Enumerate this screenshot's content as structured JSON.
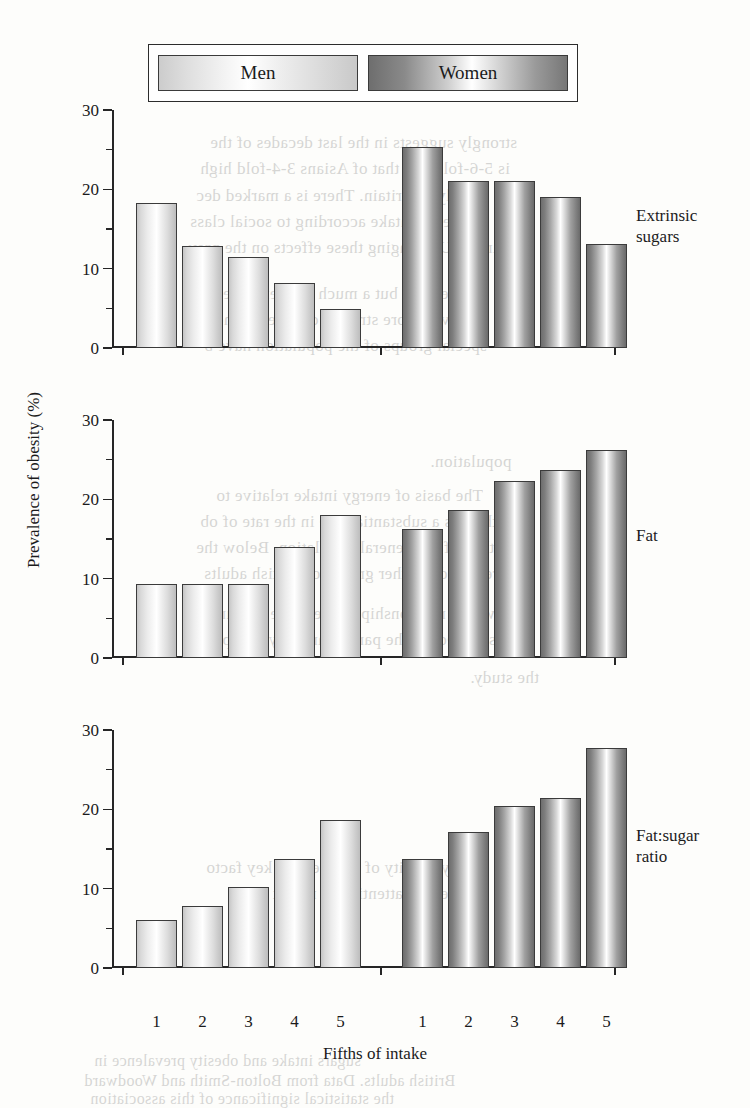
{
  "legend": {
    "items": [
      {
        "label": "Men",
        "style": "light-gradient"
      },
      {
        "label": "Women",
        "style": "dark-gradient"
      }
    ]
  },
  "axes": {
    "ylabel": "Prevalence of obesity (%)",
    "xlabel": "Fifths of intake",
    "yticks": [
      "0",
      "10",
      "20",
      "30"
    ],
    "yminor": [
      "5",
      "15",
      "25"
    ],
    "ylim": [
      0,
      30
    ],
    "xticklabels": [
      "1",
      "2",
      "3",
      "4",
      "5",
      "1",
      "2",
      "3",
      "4",
      "5"
    ]
  },
  "panels": [
    {
      "caption_line1": "Extrinsic",
      "caption_line2": "sugars"
    },
    {
      "caption_line1": "Fat",
      "caption_line2": ""
    },
    {
      "caption_line1": "Fat:sugar",
      "caption_line2": "ratio"
    }
  ],
  "colors": {
    "men_fill_light": "#ffffff",
    "men_fill_edge": "#c6c6c6",
    "women_fill_light": "#ffffff",
    "women_fill_edge": "#6d6d6d",
    "axis": "#262626",
    "bar_outline": "#3b3b3b",
    "page_background": "#fdfdfb"
  },
  "bleed_text": [
    {
      "text": "strongly suggests in the last decades of the",
      "x": 210,
      "y": 133,
      "size": 17
    },
    {
      "text": "is 5-6-fold and that of Asians 3-4-fold high",
      "x": 200,
      "y": 159,
      "size": 17
    },
    {
      "text": "supply in Britain. There is a marked dec",
      "x": 196,
      "y": 186,
      "size": 17
    },
    {
      "text": "of energy intake according to social class",
      "x": 190,
      "y": 212,
      "size": 17
    },
    {
      "text": "in the UK ranging these effects on the prev",
      "x": 188,
      "y": 238,
      "size": 17
    },
    {
      "text": "in the past, but a much greater increase",
      "x": 200,
      "y": 284,
      "size": 17
    },
    {
      "text": "and even more striking changes in the pr",
      "x": 196,
      "y": 310,
      "size": 17
    },
    {
      "text": "special groups of the population have b",
      "x": 204,
      "y": 336,
      "size": 17
    },
    {
      "text": "population.",
      "x": 430,
      "y": 452,
      "size": 17
    },
    {
      "text": "The basis of energy intake relative to",
      "x": 216,
      "y": 486,
      "size": 17
    },
    {
      "text": "there is a substantial rise in the rate of ob",
      "x": 200,
      "y": 512,
      "size": 17
    },
    {
      "text": "than of the general population. Below the",
      "x": 196,
      "y": 538,
      "size": 17
    },
    {
      "text": "reported in other groups of British adults",
      "x": 204,
      "y": 564,
      "size": 17
    },
    {
      "text": "with a relationship between the amount",
      "x": 212,
      "y": 604,
      "size": 17
    },
    {
      "text": "selected for the particular study group",
      "x": 222,
      "y": 630,
      "size": 17
    },
    {
      "text": "the study.",
      "x": 470,
      "y": 668,
      "size": 17
    },
    {
      "text": "energy density of the diet is a key facto",
      "x": 206,
      "y": 858,
      "size": 17
    },
    {
      "text": "deal of attention in recent years",
      "x": 230,
      "y": 884,
      "size": 17
    },
    {
      "text": "sugars intake and obesity prevalence in",
      "x": 94,
      "y": 1052,
      "size": 16
    },
    {
      "text": "British adults. Data from Bolton-Smith and Woodward",
      "x": 84,
      "y": 1072,
      "size": 16
    },
    {
      "text": "the statistical significance of this association",
      "x": 90,
      "y": 1090,
      "size": 16
    }
  ],
  "chart_data": [
    {
      "type": "bar",
      "title": "Extrinsic sugars",
      "xlabel": "Fifths of intake",
      "ylabel": "Prevalence of obesity (%)",
      "ylim": [
        0,
        30
      ],
      "categories": [
        "1",
        "2",
        "3",
        "4",
        "5"
      ],
      "series": [
        {
          "name": "Men",
          "values": [
            18.3,
            12.8,
            11.5,
            8.2,
            4.9
          ]
        },
        {
          "name": "Women",
          "values": [
            25.4,
            21.0,
            21.0,
            19.0,
            13.1
          ]
        }
      ]
    },
    {
      "type": "bar",
      "title": "Fat",
      "xlabel": "Fifths of intake",
      "ylabel": "Prevalence of obesity (%)",
      "ylim": [
        0,
        30
      ],
      "categories": [
        "1",
        "2",
        "3",
        "4",
        "5"
      ],
      "series": [
        {
          "name": "Men",
          "values": [
            9.3,
            9.3,
            9.3,
            14.0,
            18.0
          ]
        },
        {
          "name": "Women",
          "values": [
            16.2,
            18.6,
            22.3,
            23.7,
            26.2
          ]
        }
      ]
    },
    {
      "type": "bar",
      "title": "Fat:sugar ratio",
      "xlabel": "Fifths of intake",
      "ylabel": "Prevalence of obesity (%)",
      "ylim": [
        0,
        30
      ],
      "categories": [
        "1",
        "2",
        "3",
        "4",
        "5"
      ],
      "series": [
        {
          "name": "Men",
          "values": [
            6.0,
            7.8,
            10.2,
            13.7,
            18.7
          ]
        },
        {
          "name": "Women",
          "values": [
            13.8,
            17.1,
            20.4,
            21.4,
            27.7
          ]
        }
      ]
    }
  ]
}
